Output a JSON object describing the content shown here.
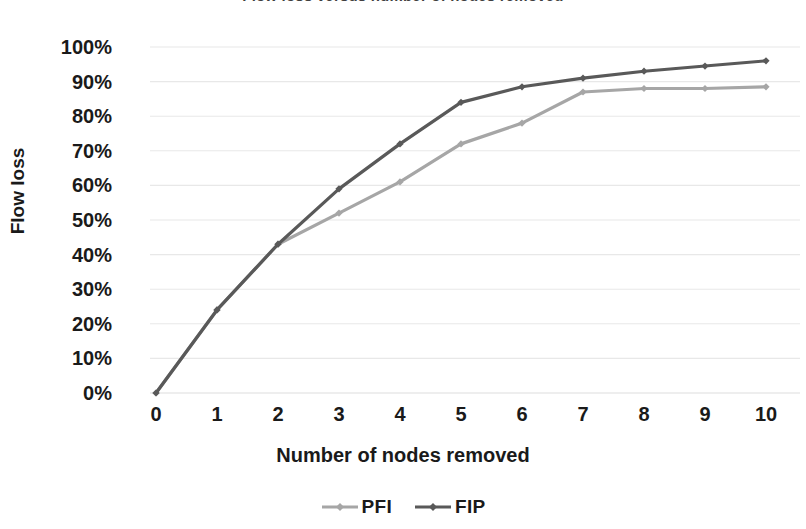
{
  "chart_data": {
    "type": "line",
    "title": "Flow loss versus number of nodes removed",
    "xlabel": "Number of nodes removed",
    "ylabel": "Flow loss",
    "x": [
      0,
      1,
      2,
      3,
      4,
      5,
      6,
      7,
      8,
      9,
      10
    ],
    "xtick_labels": [
      "0",
      "1",
      "2",
      "3",
      "4",
      "5",
      "6",
      "7",
      "8",
      "9",
      "10"
    ],
    "ytick_labels": [
      "0%",
      "10%",
      "20%",
      "30%",
      "40%",
      "50%",
      "60%",
      "70%",
      "80%",
      "90%",
      "100%"
    ],
    "ytick_values": [
      0,
      10,
      20,
      30,
      40,
      50,
      60,
      70,
      80,
      90,
      100
    ],
    "ylim": [
      0,
      100
    ],
    "xlim": [
      0,
      10
    ],
    "grid": "horizontal",
    "legend_position": "bottom",
    "series": [
      {
        "name": "PFI",
        "color": "#a6a6a6",
        "marker": "diamond",
        "values": [
          0,
          24,
          43,
          52,
          61,
          72,
          78,
          87,
          88,
          88,
          88.5
        ]
      },
      {
        "name": "FIP",
        "color": "#595959",
        "marker": "diamond",
        "values": [
          0,
          24,
          43,
          59,
          72,
          84,
          88.5,
          91,
          93,
          94.5,
          96
        ]
      }
    ]
  },
  "legend": {
    "items": [
      {
        "label": "PFI",
        "color": "#a6a6a6"
      },
      {
        "label": "FIP",
        "color": "#595959"
      }
    ]
  },
  "axes": {
    "y_title": "Flow loss",
    "x_title": "Number of nodes removed"
  },
  "colors": {
    "background": "#ffffff",
    "gridline": "#e8e8e8",
    "text": "#1a1a1a",
    "series_light": "#a6a6a6",
    "series_dark": "#595959"
  }
}
